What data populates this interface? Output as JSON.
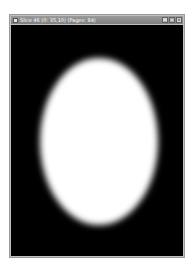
{
  "window": {
    "title": "Slice 46 (0: 35,10)  (Pages: 84)",
    "buttons": [
      {
        "name": "minimize",
        "glyph": "_"
      },
      {
        "name": "maximize",
        "glyph": "□"
      },
      {
        "name": "close",
        "glyph": "×"
      }
    ]
  },
  "canvas": {
    "background": "#000000",
    "shape": "ellipse",
    "fill": "#ffffff"
  }
}
